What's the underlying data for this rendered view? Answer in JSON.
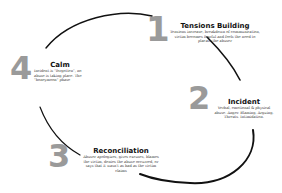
{
  "diagram": {
    "type": "cycle",
    "stages": [
      {
        "number": "1",
        "title": "Tensions Building",
        "description": "Tensions increase, breakdown of communication, victim becomes fearful and feels the need to placate the abuser"
      },
      {
        "number": "2",
        "title": "Incident",
        "description": "Verbal, emotional & physical abuse. Anger. Blaming. Arguing. Threats. Intimidation."
      },
      {
        "number": "3",
        "title": "Reconciliation",
        "description": "Abuser apologizes, gives excuses, blames the victim, denies the abuse occurred, or says that it wasn't as bad as the victim claims"
      },
      {
        "number": "4",
        "title": "Calm",
        "description": "Incident is \"forgotten\", no abuse is taking place. The \"honeymoon\" phase"
      }
    ],
    "colors": {
      "arc": "#111111",
      "number": "#9a9a9a",
      "title": "#111111",
      "text": "#333333",
      "background": "#ffffff"
    }
  }
}
